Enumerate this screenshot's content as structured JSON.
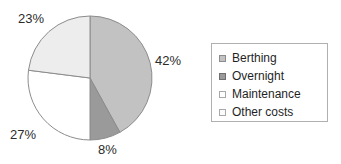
{
  "chart_data": {
    "type": "pie",
    "title": "",
    "categories": [
      "Berthing",
      "Overnight",
      "Maintenance",
      "Other costs"
    ],
    "values": [
      42,
      8,
      27,
      23
    ],
    "value_labels": [
      "42%",
      "8%",
      "27%",
      "23%"
    ],
    "colors": [
      "#c2c2c2",
      "#9a9a9a",
      "#ffffff",
      "#ededed"
    ],
    "slice_border_color": "#8c8c8c",
    "start_angle_deg": 0,
    "direction": "clockwise",
    "legend": {
      "position": "right",
      "border_color": "#b0b0b0",
      "entries": [
        {
          "label": "Berthing",
          "color": "#c2c2c2",
          "swatch_border": "#8c8c8c"
        },
        {
          "label": "Overnight",
          "color": "#9a9a9a",
          "swatch_border": "#6f6f6f"
        },
        {
          "label": "Maintenance",
          "color": "#ffffff",
          "swatch_border": "#a8a8a8"
        },
        {
          "label": "Other costs",
          "color": "#fbfbfb",
          "swatch_border": "#a8a8a8"
        }
      ]
    },
    "xlabel": "",
    "ylabel": "",
    "grid": false
  },
  "labels": {
    "berthing_pct": "42%",
    "overnight_pct": "8%",
    "maintenance_pct": "27%",
    "other_costs_pct": "23%"
  },
  "legend": {
    "items": [
      {
        "label": "Berthing"
      },
      {
        "label": "Overnight"
      },
      {
        "label": "Maintenance"
      },
      {
        "label": "Other costs"
      }
    ]
  }
}
